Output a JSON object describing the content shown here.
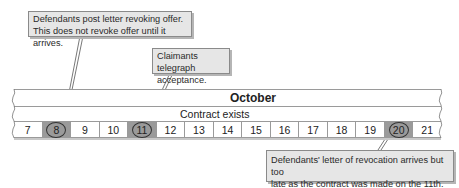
{
  "callouts": {
    "post_letter": {
      "line1": "Defendants post letter revoking offer.",
      "line2": "This does not revoke offer until it arrives."
    },
    "telegraph": {
      "line1": "Claimants telegraph",
      "line2": "acceptance."
    },
    "revocation_arrives": {
      "line1": "Defendants' letter of revocation arrives but too",
      "line2": "late as the contract was made on the 11th."
    }
  },
  "calendar": {
    "month": "October",
    "contract_label": "Contract exists",
    "days": [
      {
        "label": "7",
        "highlighted": false,
        "circled": false
      },
      {
        "label": "8",
        "highlighted": true,
        "circled": true
      },
      {
        "label": "9",
        "highlighted": false,
        "circled": false
      },
      {
        "label": "10",
        "highlighted": false,
        "circled": false
      },
      {
        "label": "11",
        "highlighted": true,
        "circled": true
      },
      {
        "label": "12",
        "highlighted": false,
        "circled": false
      },
      {
        "label": "13",
        "highlighted": false,
        "circled": false
      },
      {
        "label": "14",
        "highlighted": false,
        "circled": false
      },
      {
        "label": "15",
        "highlighted": false,
        "circled": false
      },
      {
        "label": "16",
        "highlighted": false,
        "circled": false
      },
      {
        "label": "17",
        "highlighted": false,
        "circled": false
      },
      {
        "label": "18",
        "highlighted": false,
        "circled": false
      },
      {
        "label": "19",
        "highlighted": false,
        "circled": false
      },
      {
        "label": "20",
        "highlighted": true,
        "circled": true
      },
      {
        "label": "21",
        "highlighted": false,
        "circled": false
      }
    ]
  },
  "colors": {
    "highlight": "#9a9a9a",
    "callout_bg": "#e6e6e6",
    "border": "#9a9a9a"
  }
}
